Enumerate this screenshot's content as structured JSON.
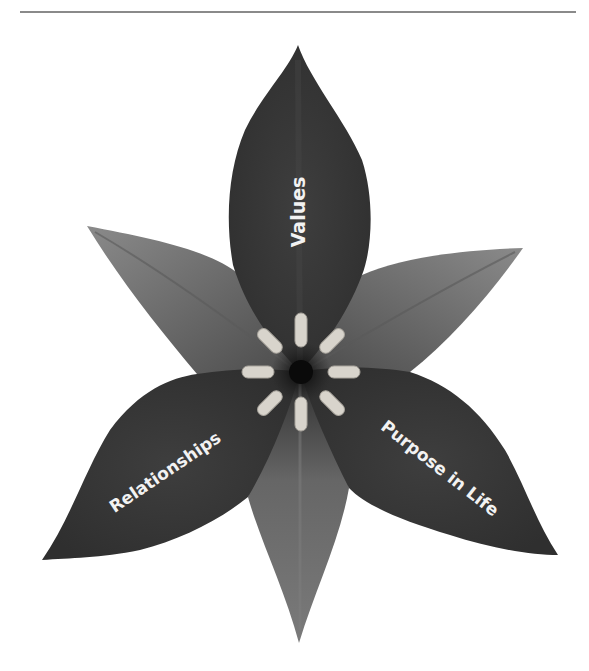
{
  "diagram": {
    "type": "flower",
    "petals": [
      {
        "id": "top",
        "label": "Values"
      },
      {
        "id": "lower-left",
        "label": "Relationships"
      },
      {
        "id": "lower-right",
        "label": "Purpose in Life"
      }
    ],
    "sepals": [
      {
        "id": "upper-left"
      },
      {
        "id": "upper-right"
      },
      {
        "id": "bottom"
      }
    ],
    "center": {
      "stamen_count": 8
    },
    "colors": {
      "petal": "#3a3a3a",
      "sepal": "#6e6e6e",
      "stamen": "#d8d4cc",
      "label": "#f2f2f2",
      "rule": "#8a8a8a"
    }
  }
}
